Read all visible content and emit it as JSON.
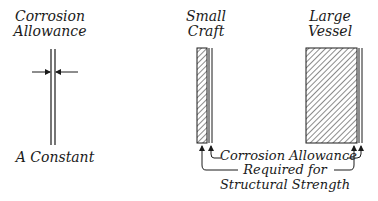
{
  "left": {
    "title_line1": "Corrosion",
    "title_line2": "Allowance",
    "caption": "A Constant"
  },
  "small_craft": {
    "title_line1": "Small",
    "title_line2": "Craft"
  },
  "large_vessel": {
    "title_line1": "Large",
    "title_line2": "Vessel"
  },
  "annotations": {
    "corrosion_allowance": "Corrosion Allowance",
    "required_line1": "Required for",
    "required_line2": "Structural Strength"
  },
  "colors": {
    "ink": "#1a1a1a",
    "background": "#ffffff"
  }
}
